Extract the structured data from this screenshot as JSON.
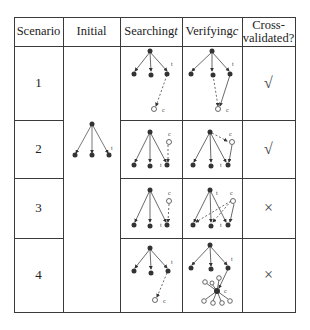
{
  "table": {
    "headers": [
      {
        "text": "Scenario"
      },
      {
        "text": "Initial"
      },
      {
        "text": "Searching ",
        "var": "t"
      },
      {
        "text": "Verifying ",
        "var": "c"
      },
      {
        "text": "Cross-validated?",
        "line1": "Cross-",
        "line2": "validated?"
      }
    ],
    "rows": [
      {
        "scenario": "1",
        "cross_validated": "√",
        "cross_validated_bool": true
      },
      {
        "scenario": "2",
        "cross_validated": "√",
        "cross_validated_bool": true
      },
      {
        "scenario": "3",
        "cross_validated": "×",
        "cross_validated_bool": false
      },
      {
        "scenario": "4",
        "cross_validated": "×",
        "cross_validated_bool": false
      }
    ],
    "node_labels": {
      "target": "t",
      "candidate": "c"
    }
  }
}
